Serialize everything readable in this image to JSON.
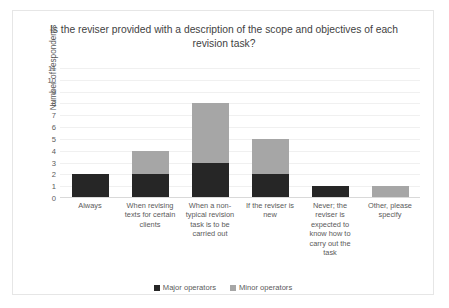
{
  "chart_data": {
    "type": "bar",
    "subtype": "stacked-column",
    "title": "Is the reviser provided with a description of the scope and objectives of each revision task?",
    "xlabel": "",
    "ylabel": "Number of respondents",
    "ylim": [
      0,
      11
    ],
    "ytick_labels": [
      "11",
      "10",
      "9",
      "8",
      "7",
      "6",
      "5",
      "4",
      "3",
      "2",
      "1",
      "0"
    ],
    "ytick_values": [
      11,
      10,
      9,
      8,
      7,
      6,
      5,
      4,
      3,
      2,
      1,
      0
    ],
    "grid": true,
    "legend_position": "bottom",
    "categories": [
      "Always",
      "When revising texts for certain clients",
      "When a non-typical revision task is to be carried out",
      "If the reviser is new",
      "Never; the reviser is expected to know how to carry out the task",
      "Other, please specify"
    ],
    "series": [
      {
        "name": "Major operators",
        "color": "#262626",
        "values": [
          2,
          2,
          3,
          2,
          1,
          0
        ]
      },
      {
        "name": "Minor operators",
        "color": "#a6a6a6",
        "values": [
          0,
          2,
          5,
          3,
          0,
          1
        ]
      }
    ],
    "totals": [
      2,
      4,
      8,
      5,
      1,
      1
    ]
  }
}
